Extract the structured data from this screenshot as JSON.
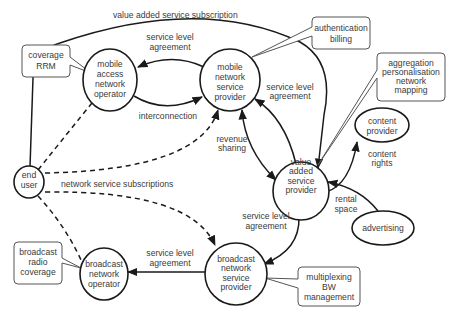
{
  "diagram": {
    "nodes": [
      {
        "id": "mobile_access_network_operator",
        "lines": [
          "mobile",
          "access",
          "network",
          "operator"
        ]
      },
      {
        "id": "mobile_network_service_provider",
        "lines": [
          "mobile",
          "network",
          "service",
          "provider"
        ]
      },
      {
        "id": "value_added_service_provider",
        "lines": [
          "value",
          "added",
          "service",
          "provider"
        ]
      },
      {
        "id": "content_provider",
        "lines": [
          "content",
          "provider"
        ]
      },
      {
        "id": "advertising",
        "lines": [
          "advertising"
        ]
      },
      {
        "id": "end_user",
        "lines": [
          "end",
          "user"
        ]
      },
      {
        "id": "broadcast_network_operator",
        "lines": [
          "broadcast",
          "network",
          "operator"
        ]
      },
      {
        "id": "broadcast_network_service_provider",
        "lines": [
          "broadcast",
          "network",
          "service",
          "provider"
        ]
      }
    ],
    "callouts": [
      {
        "id": "coverage_rrm",
        "lines": [
          "coverage",
          "RRM"
        ]
      },
      {
        "id": "authentication_billing",
        "lines": [
          "authentication",
          "billing"
        ]
      },
      {
        "id": "aggregation",
        "lines": [
          "aggregation",
          "personalisation",
          "network",
          "mapping"
        ]
      },
      {
        "id": "broadcast_radio_coverage",
        "lines": [
          "broadcast",
          "radio",
          "coverage"
        ]
      },
      {
        "id": "multiplexing",
        "lines": [
          "multiplexing",
          "BW",
          "management"
        ]
      }
    ],
    "edge_labels": {
      "value_added_service_subscription": "value added service subscription",
      "sla_mobile_1": "service level",
      "sla_mobile_2": "agreement",
      "interconnection": "interconnection",
      "sla_vas_1": "service level",
      "sla_vas_2": "agreement",
      "revenue_1": "revenue",
      "revenue_2": "sharing",
      "content_rights_1": "content",
      "content_rights_2": "rights",
      "rental_1": "rental",
      "rental_2": "space",
      "network_service_subscriptions": "network service subscriptions",
      "sla_bc_vas_1": "service level",
      "sla_bc_vas_2": "agreement",
      "sla_bc_1": "service level",
      "sla_bc_2": "agreement"
    }
  }
}
